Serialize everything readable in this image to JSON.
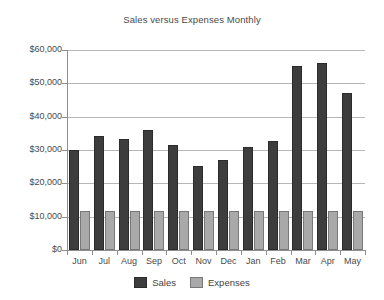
{
  "chart_data": {
    "type": "bar",
    "title": "Sales versus Expenses Monthly",
    "xlabel": "",
    "ylabel": "",
    "categories": [
      "Jun",
      "Jul",
      "Aug",
      "Sep",
      "Oct",
      "Nov",
      "Dec",
      "Jan",
      "Feb",
      "Mar",
      "Apr",
      "May"
    ],
    "series": [
      {
        "name": "Sales",
        "color": "#3d3d3d",
        "values": [
          30000,
          34200,
          33300,
          36000,
          31600,
          25200,
          27000,
          31000,
          32700,
          55200,
          56100,
          47200
        ]
      },
      {
        "name": "Expenses",
        "color": "#a9a9a9",
        "values": [
          11800,
          11800,
          11800,
          11800,
          11800,
          11800,
          11800,
          11800,
          11800,
          11800,
          11800,
          11800
        ]
      }
    ],
    "ylim": [
      0,
      60000
    ],
    "y_ticks": [
      0,
      10000,
      20000,
      30000,
      40000,
      50000,
      60000
    ],
    "y_tick_labels": [
      "$0",
      "$10,000",
      "$20,000",
      "$30,000",
      "$40,000",
      "$50,000",
      "$60,000"
    ],
    "grid": true,
    "legend_position": "bottom",
    "legend_entries": [
      "Sales",
      "Expenses"
    ]
  }
}
